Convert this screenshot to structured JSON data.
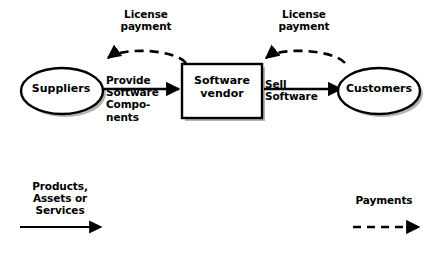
{
  "diagram": {
    "title_hidden": "Software vendor value chain",
    "nodes": [
      {
        "id": "suppliers",
        "label": "Suppliers",
        "shape": "ellipse"
      },
      {
        "id": "vendor",
        "label": "Software\nvendor",
        "shape": "rectangle"
      },
      {
        "id": "customers",
        "label": "Customers",
        "shape": "ellipse"
      }
    ],
    "flows": [
      {
        "id": "provide",
        "label": "Provide\nSoftware\nCompo-\nnents",
        "from": "suppliers",
        "to": "vendor",
        "style": "solid"
      },
      {
        "id": "sell",
        "label": "Sell\nSoftware",
        "from": "vendor",
        "to": "customers",
        "style": "solid"
      },
      {
        "id": "license-left",
        "label": "License\npayment",
        "from": "vendor",
        "to": "suppliers",
        "style": "dashed"
      },
      {
        "id": "license-right",
        "label": "License\npayment",
        "from": "customers",
        "to": "vendor",
        "style": "dashed"
      }
    ],
    "legend": [
      {
        "id": "goods",
        "label": "Products,\nAssets or\nServices",
        "style": "solid"
      },
      {
        "id": "money",
        "label": "Payments",
        "style": "dashed"
      }
    ],
    "colors": {
      "stroke": "#000000",
      "fill": "#ffffff",
      "text": "#000000",
      "shadow": "#a8a8a8",
      "background": "#ffffff"
    }
  }
}
